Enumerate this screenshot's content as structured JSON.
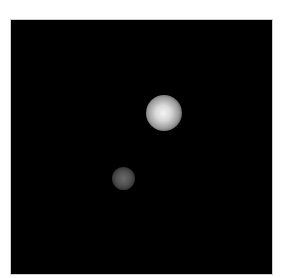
{
  "image": {
    "description": "Grayscale microscopy-style image: two glowing spots on a black background",
    "background_color": "#000000",
    "spots": [
      {
        "label": "bright-spot",
        "center_x": 155,
        "center_y": 112,
        "radius": 18,
        "intensity": "high"
      },
      {
        "label": "dim-spot",
        "center_x": 122,
        "center_y": 178,
        "radius": 11,
        "intensity": "low"
      }
    ]
  }
}
